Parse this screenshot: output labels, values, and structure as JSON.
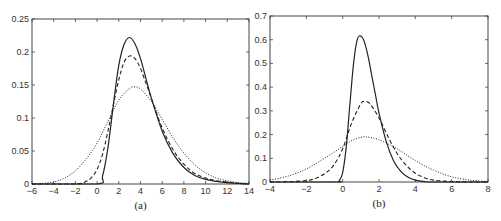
{
  "chart_data": [
    {
      "type": "line",
      "caption": "(a)",
      "xlim": [
        -6,
        14
      ],
      "ylim": [
        0,
        0.25
      ],
      "xticks": [
        -6,
        -4,
        -2,
        0,
        2,
        4,
        6,
        8,
        10,
        12,
        14
      ],
      "yticks": [
        0,
        0.05,
        0.1,
        0.15,
        0.2,
        0.25
      ],
      "ytick_labels": [
        "0",
        "0.05",
        "0.1",
        "0.15",
        "0.2",
        "0.25"
      ],
      "grid": false,
      "legend": "none",
      "series": [
        {
          "name": "solid",
          "style": "solid",
          "x": [
            -6,
            0,
            0.5,
            1,
            1.5,
            2,
            2.5,
            3,
            3.5,
            4,
            4.5,
            5,
            6,
            7,
            8,
            9,
            10,
            11,
            12,
            13,
            14
          ],
          "y": [
            0,
            0,
            0.012,
            0.055,
            0.12,
            0.18,
            0.212,
            0.222,
            0.212,
            0.19,
            0.16,
            0.13,
            0.08,
            0.046,
            0.025,
            0.013,
            0.007,
            0.004,
            0.002,
            0.001,
            0
          ]
        },
        {
          "name": "dashed",
          "style": "dashed",
          "x": [
            -6,
            -2,
            -1,
            -0.5,
            0,
            0.5,
            1,
            1.5,
            2,
            2.5,
            3,
            3.5,
            4,
            4.5,
            5,
            6,
            7,
            8,
            9,
            10,
            11,
            12,
            13,
            14
          ],
          "y": [
            0,
            0,
            0.004,
            0.01,
            0.022,
            0.045,
            0.08,
            0.12,
            0.158,
            0.185,
            0.194,
            0.19,
            0.175,
            0.153,
            0.13,
            0.085,
            0.052,
            0.03,
            0.016,
            0.009,
            0.005,
            0.003,
            0.001,
            0
          ]
        },
        {
          "name": "dotted",
          "style": "dotted",
          "x": [
            -6,
            -5,
            -4,
            -3,
            -2,
            -1,
            0,
            1,
            2,
            3,
            3.5,
            4,
            5,
            6,
            7,
            8,
            9,
            10,
            11,
            12,
            13,
            14
          ],
          "y": [
            0,
            0.001,
            0.003,
            0.009,
            0.02,
            0.038,
            0.062,
            0.095,
            0.127,
            0.145,
            0.147,
            0.144,
            0.125,
            0.098,
            0.07,
            0.047,
            0.029,
            0.017,
            0.009,
            0.005,
            0.002,
            0.001
          ]
        }
      ]
    },
    {
      "type": "line",
      "caption": "(b)",
      "xlim": [
        -4,
        8
      ],
      "ylim": [
        0,
        0.7
      ],
      "xticks": [
        -4,
        -2,
        0,
        2,
        4,
        6,
        8
      ],
      "yticks": [
        0,
        0.1,
        0.2,
        0.3,
        0.4,
        0.5,
        0.6,
        0.7
      ],
      "ytick_labels": [
        "0",
        "0.1",
        "0.2",
        "0.3",
        "0.4",
        "0.5",
        "0.6",
        "0.7"
      ],
      "grid": false,
      "legend": "none",
      "series": [
        {
          "name": "solid",
          "style": "solid",
          "x": [
            -4,
            -0.4,
            -0.2,
            0,
            0.2,
            0.4,
            0.6,
            0.8,
            1,
            1.2,
            1.4,
            1.6,
            1.8,
            2,
            2.4,
            2.8,
            3.2,
            3.6,
            4,
            4.5,
            5,
            8
          ],
          "y": [
            0,
            0,
            0.005,
            0.04,
            0.15,
            0.33,
            0.5,
            0.6,
            0.615,
            0.59,
            0.53,
            0.45,
            0.37,
            0.29,
            0.17,
            0.09,
            0.045,
            0.02,
            0.008,
            0.002,
            0,
            0
          ]
        },
        {
          "name": "dashed",
          "style": "dashed",
          "x": [
            -4,
            -3,
            -2,
            -1.5,
            -1,
            -0.5,
            0,
            0.5,
            1,
            1.2,
            1.5,
            2,
            2.5,
            3,
            3.5,
            4,
            4.5,
            5,
            6,
            7,
            8
          ],
          "y": [
            0,
            0.001,
            0.006,
            0.015,
            0.035,
            0.07,
            0.14,
            0.25,
            0.33,
            0.34,
            0.33,
            0.27,
            0.19,
            0.12,
            0.07,
            0.037,
            0.018,
            0.008,
            0.002,
            0,
            0
          ]
        },
        {
          "name": "dotted",
          "style": "dotted",
          "x": [
            -4,
            -3,
            -2,
            -1,
            0,
            0.5,
            1,
            1.3,
            2,
            3,
            4,
            5,
            6,
            7,
            8
          ],
          "y": [
            0.008,
            0.025,
            0.055,
            0.1,
            0.15,
            0.175,
            0.188,
            0.19,
            0.178,
            0.14,
            0.09,
            0.05,
            0.022,
            0.008,
            0.002
          ]
        }
      ]
    }
  ]
}
